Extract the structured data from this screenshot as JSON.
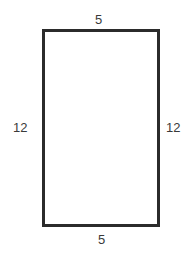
{
  "diagram": {
    "shape": "rectangle",
    "labels": {
      "top": "5",
      "bottom": "5",
      "left": "12",
      "right": "12"
    },
    "colors": {
      "stroke": "#2b2b2b",
      "text": "#3a3a3a",
      "background": "#ffffff"
    }
  }
}
